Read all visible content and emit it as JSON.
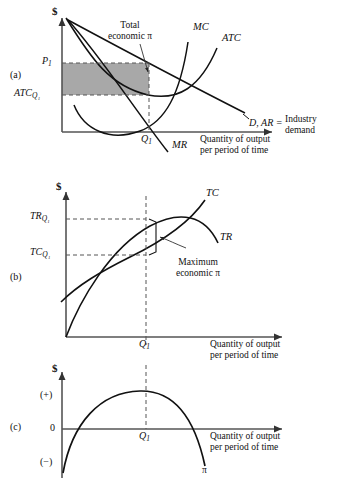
{
  "figure": {
    "panels": [
      {
        "id": "a",
        "label": "(a)"
      },
      {
        "id": "b",
        "label": "(b)"
      },
      {
        "id": "c",
        "label": "(c)"
      }
    ]
  },
  "panel_a": {
    "y_axis_label": "$",
    "x_axis_label_line1": "Quantity of output",
    "x_axis_label_line2": "per period of time",
    "y_tick_price": "P",
    "y_tick_price_sub": "1",
    "y_tick_atc": "ATC",
    "y_tick_atc_sub": "Q₁",
    "x_tick_q": "Q",
    "x_tick_q_sub": "1",
    "curve_mc": "MC",
    "curve_atc": "ATC",
    "curve_mr": "MR",
    "curve_demand": "D, AR =",
    "curve_demand_line1": "Industry",
    "curve_demand_line2": "demand",
    "annotation_line1": "Total",
    "annotation_line2": "economic π",
    "shade_color": "#a8a8a8"
  },
  "panel_b": {
    "y_axis_label": "$",
    "x_axis_label_line1": "Quantity of output",
    "x_axis_label_line2": "per period of time",
    "y_tick_tr": "TR",
    "y_tick_tr_sub": "Q₁",
    "y_tick_tc": "TC",
    "y_tick_tc_sub": "Q₁",
    "x_tick_q": "Q",
    "x_tick_q_sub": "1",
    "curve_tc": "TC",
    "curve_tr": "TR",
    "annotation_line1": "Maximum",
    "annotation_line2": "economic π"
  },
  "panel_c": {
    "y_axis_label": "$",
    "x_axis_label_line1": "Quantity of output",
    "x_axis_label_line2": "per period of time",
    "y_tick_positive": "(+)",
    "y_tick_zero": "0",
    "y_tick_negative": "(−)",
    "x_tick_q": "Q",
    "x_tick_q_sub": "1",
    "curve_profit": "π"
  },
  "colors": {
    "ink": "#1a1a1a",
    "axis": "#555555",
    "shade": "#a8a8a8",
    "dash": "#666666"
  }
}
